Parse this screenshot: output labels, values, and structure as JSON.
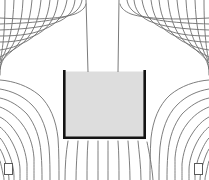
{
  "figure": {
    "width": 209,
    "height": 180,
    "background_color": "#ffffff"
  },
  "colors": {
    "fieldline_stroke": "#6f6f6f",
    "leadline_stroke": "#7a7a7a",
    "vessel_wall": "#141414",
    "vessel_fill": "#dddddd",
    "corner_marker_stroke": "#5a5a5a",
    "corner_marker_fill": "#ffffff"
  },
  "vessel": {
    "name": "crucible",
    "left_x": 63,
    "right_x": 146,
    "top_y": 70,
    "bottom_y": 139,
    "wall_thickness": 2.6,
    "fill_label": "melt",
    "fill_color": "#dddddd",
    "open_top": true
  },
  "lead_lines": {
    "count": 2,
    "description": "two near-vertical lines rising from vessel top to image top",
    "top_x": [
      86,
      119
    ],
    "bottom_x": [
      88,
      118
    ],
    "top_y": 0,
    "bottom_y": 72
  },
  "corner_markers": [
    {
      "name": "marker-bottom-left",
      "x": 4,
      "y": 163,
      "width": 8,
      "height": 11
    },
    {
      "name": "marker-bottom-right",
      "x": 194,
      "y": 163,
      "width": 8,
      "height": 11
    }
  ],
  "chart_data": {
    "type": "line",
    "xlabel": "",
    "ylabel": "",
    "xlim": [
      0,
      209
    ],
    "ylim": [
      0,
      180
    ],
    "grid": false,
    "legend": "none",
    "annotations": [
      "Concentric field arcs wrap the upper-left and upper-right vessel corners",
      "Field lines fan downward from the vessel base",
      "Two straight lead lines rise vertically from the vessel mouth"
    ],
    "series": [
      {
        "name": "upper-left-arcs",
        "count": 11,
        "kind": "concentric-arc",
        "center_x": 63,
        "center_y": 70
      },
      {
        "name": "upper-right-arcs",
        "count": 11,
        "kind": "concentric-arc",
        "center_x": 146,
        "center_y": 70
      },
      {
        "name": "lower-left-arcs",
        "count": 9,
        "kind": "concentric-arc",
        "center_x": 63,
        "center_y": 139
      },
      {
        "name": "lower-right-arcs",
        "count": 9,
        "kind": "concentric-arc",
        "center_x": 146,
        "center_y": 139
      },
      {
        "name": "bottom-fan-lines",
        "count": 9,
        "kind": "fan",
        "origin_y": 139
      },
      {
        "name": "lead-lines",
        "count": 2,
        "kind": "straight-vertical"
      }
    ]
  }
}
